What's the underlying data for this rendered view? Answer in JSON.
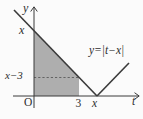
{
  "figure": {
    "colors": {
      "background": "#fbfbfb",
      "ink": "#3a3a3a",
      "shade": "#aeaeae",
      "dash": "#5a5a5a"
    },
    "labels": {
      "y_axis": "y",
      "t_axis": "t",
      "origin": "O",
      "y_intercept": "x",
      "dashed_level": "x−3",
      "tick_3": "3",
      "vertex_x": "x",
      "equation": "y=|t−x|"
    },
    "graph": {
      "equation": "y = |t − x|",
      "vertex": [
        "x",
        0
      ],
      "y_intercept": [
        0,
        "x"
      ],
      "dashed_line_level": "x−3",
      "dashed_line_meets_graph_at_t": "3",
      "shaded_region": "area under y=|t−x| between t=0 and t=3"
    }
  }
}
